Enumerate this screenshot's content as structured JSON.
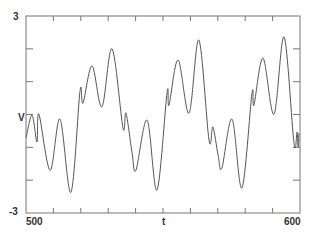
{
  "chart_data": {
    "type": "line",
    "title": "",
    "xlabel": "t",
    "ylabel": "V",
    "xlim": [
      500,
      600
    ],
    "ylim": [
      -3,
      3
    ],
    "x_tick_labels": [
      "500",
      "600"
    ],
    "y_tick_labels": [
      "3",
      "-3"
    ],
    "x_ticks_count": 11,
    "y_ticks_count": 7,
    "grid": false,
    "legend": null,
    "series": [
      {
        "name": "V(t)",
        "color": "#555555",
        "points": [
          [
            500.0,
            -0.72
          ],
          [
            502.2,
            -0.02
          ],
          [
            504.0,
            -0.84
          ],
          [
            504.7,
            0.01
          ],
          [
            508.8,
            -1.7
          ],
          [
            512.4,
            -0.14
          ],
          [
            516.4,
            -2.37
          ],
          [
            519.7,
            0.71
          ],
          [
            520.8,
            0.35
          ],
          [
            524.1,
            1.48
          ],
          [
            527.7,
            0.23
          ],
          [
            531.4,
            2.0
          ],
          [
            535.4,
            -0.41
          ],
          [
            536.5,
            0.04
          ],
          [
            538.7,
            -1.15
          ],
          [
            540.1,
            -1.7
          ],
          [
            544.2,
            -0.17
          ],
          [
            547.8,
            -2.3
          ],
          [
            551.5,
            0.68
          ],
          [
            552.2,
            0.29
          ],
          [
            555.5,
            1.66
          ],
          [
            559.5,
            0.04
          ],
          [
            563.1,
            2.27
          ],
          [
            566.8,
            -0.78
          ],
          [
            568.2,
            -0.38
          ],
          [
            570.1,
            -1.24
          ],
          [
            571.5,
            -1.63
          ],
          [
            575.2,
            -0.14
          ],
          [
            578.8,
            -2.24
          ],
          [
            582.5,
            0.65
          ],
          [
            583.2,
            0.29
          ],
          [
            586.5,
            1.72
          ],
          [
            590.5,
            0.01
          ],
          [
            594.2,
            2.36
          ],
          [
            597.8,
            -0.87
          ],
          [
            598.9,
            -0.54
          ],
          [
            599.3,
            -0.99
          ],
          [
            599.6,
            -0.57
          ]
        ]
      }
    ]
  },
  "labels": {
    "y_top": "3",
    "y_bottom": "-3",
    "y_axis": "V",
    "x_left": "500",
    "x_right": "600",
    "x_axis": "t"
  }
}
